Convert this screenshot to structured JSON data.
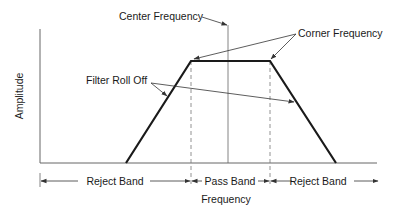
{
  "diagram": {
    "axes": {
      "y_label": "Amplitude",
      "x_label": "Frequency"
    },
    "annotations": {
      "center_frequency": "Center Frequency",
      "corner_frequency": "Corner Frequency",
      "filter_roll_off": "Filter Roll Off"
    },
    "bands": [
      {
        "label": "Reject Band"
      },
      {
        "label": "Pass Band"
      },
      {
        "label": "Reject Band"
      }
    ],
    "colors": {
      "curve": "#1a1a1a",
      "axis": "#555555",
      "guide": "#777777"
    }
  }
}
